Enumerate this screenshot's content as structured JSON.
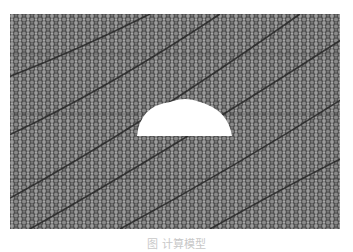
{
  "figure": {
    "background_color": "#5a5a5a",
    "particle_light": "#9a9a9a",
    "particle_dark": "#4a4a4a",
    "band_color": "#2a2a2a",
    "cavity_color": "#ffffff",
    "cavity": {
      "cx": 175,
      "cy": 122,
      "rx": 38,
      "ry": 33
    }
  },
  "caption": {
    "text": "图      计算模型"
  }
}
